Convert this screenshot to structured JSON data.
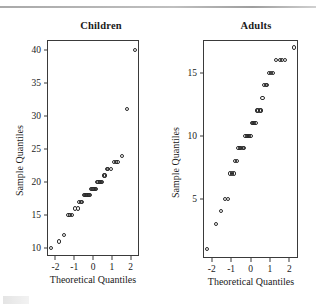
{
  "figure": {
    "background": "#ffffff",
    "point_color": "#2b2b2b",
    "axis_color": "#3a3a3a",
    "rule_color": "#9a9a9a"
  },
  "panels": [
    {
      "id": "children",
      "title": "Children",
      "xlabel": "Theoretical Quantiles",
      "ylabel": "Sample Quantiles",
      "xticks": [
        "-2",
        "-1",
        "0",
        "1",
        "2"
      ],
      "yticks": [
        "10",
        "15",
        "20",
        "25",
        "30",
        "35",
        "40"
      ]
    },
    {
      "id": "adults",
      "title": "Adults",
      "xlabel": "Theoretical Quantiles",
      "ylabel": "Sample Quantiles",
      "xticks": [
        "-2",
        "-1",
        "0",
        "1",
        "2"
      ],
      "yticks": [
        "5",
        "10",
        "15"
      ]
    }
  ],
  "chart_data": [
    {
      "type": "scatter",
      "title": "Children",
      "xlabel": "Theoretical Quantiles",
      "ylabel": "Sample Quantiles",
      "xlim": [
        -2.45,
        2.45
      ],
      "ylim": [
        8.8,
        41.5
      ],
      "xticks": [
        -2,
        -1,
        0,
        1,
        2
      ],
      "yticks": [
        10,
        15,
        20,
        25,
        30,
        35,
        40
      ],
      "grid": false,
      "legend": "none",
      "marker": "open-circle",
      "x": [
        -2.23,
        -1.79,
        -1.53,
        -1.3,
        -1.22,
        -1.14,
        -0.95,
        -0.82,
        -0.73,
        -0.65,
        -0.57,
        -0.5,
        -0.43,
        -0.36,
        -0.29,
        -0.23,
        -0.16,
        -0.1,
        -0.03,
        0.03,
        0.1,
        0.16,
        0.23,
        0.29,
        0.36,
        0.43,
        0.5,
        0.57,
        0.65,
        0.73,
        0.82,
        0.95,
        1.14,
        1.22,
        1.3,
        1.53,
        1.79,
        2.23
      ],
      "y": [
        10,
        11,
        12,
        15,
        15,
        15,
        16,
        16,
        17,
        17,
        17,
        18,
        18,
        18,
        18,
        18,
        18,
        19,
        19,
        19,
        19,
        19,
        20,
        20,
        20,
        20,
        20,
        21,
        21,
        22,
        22,
        22,
        23,
        23,
        23,
        24,
        31,
        40
      ]
    },
    {
      "type": "scatter",
      "title": "Adults",
      "xlabel": "Theoretical Quantiles",
      "ylabel": "Sample Quantiles",
      "xlim": [
        -2.45,
        2.45
      ],
      "ylim": [
        0.3,
        17.6
      ],
      "xticks": [
        -2,
        -1,
        0,
        1,
        2
      ],
      "yticks": [
        5,
        10,
        15
      ],
      "grid": false,
      "legend": "none",
      "marker": "open-circle",
      "x": [
        -2.23,
        -1.79,
        -1.53,
        -1.3,
        -1.14,
        -1.05,
        -0.95,
        -0.86,
        -0.78,
        -0.7,
        -0.62,
        -0.54,
        -0.47,
        -0.4,
        -0.33,
        -0.26,
        -0.19,
        -0.13,
        -0.06,
        0.0,
        0.06,
        0.13,
        0.19,
        0.26,
        0.33,
        0.4,
        0.47,
        0.54,
        0.62,
        0.7,
        0.78,
        0.86,
        0.95,
        1.05,
        1.14,
        1.3,
        1.53,
        1.62,
        1.79,
        2.23
      ],
      "y": [
        1,
        3,
        4,
        5,
        5,
        7,
        7,
        7,
        8,
        8,
        9,
        9,
        9,
        9,
        9,
        10,
        10,
        10,
        10,
        10,
        11,
        11,
        11,
        11,
        12,
        12,
        12,
        12,
        13,
        14,
        14,
        14,
        15,
        15,
        15,
        16,
        16,
        16,
        16,
        17
      ]
    }
  ]
}
